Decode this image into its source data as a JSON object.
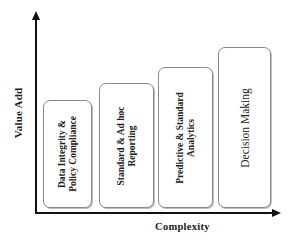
{
  "diagram": {
    "axes": {
      "y_label": "Value Add",
      "x_label": "Complexity"
    },
    "stages": [
      {
        "lines": [
          "Data Integrity  &",
          "Policy Compliance"
        ]
      },
      {
        "lines": [
          "Standard  & Ad hoc",
          "Reporting"
        ]
      },
      {
        "lines": [
          "Predictive & Standard",
          "Analytics"
        ]
      },
      {
        "lines": [
          "Decision Making"
        ]
      }
    ]
  }
}
